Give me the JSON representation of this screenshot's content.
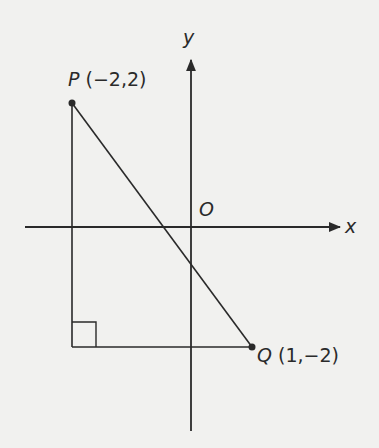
{
  "diagram": {
    "axes": {
      "x_label": "x",
      "y_label": "y",
      "origin_label": "O"
    },
    "points": [
      {
        "name": "P",
        "coords": "(−2, 2)",
        "x": -2,
        "y": 2
      },
      {
        "name": "Q",
        "coords": "(1, −2)",
        "x": 1,
        "y": -2
      }
    ],
    "labels": {
      "p_name": "P",
      "p_coords": "(−2,2)",
      "q_name": "Q",
      "q_coords": "(1,−2)"
    },
    "shapes": [
      "right triangle with legs parallel to axes",
      "segment PQ",
      "right-angle marker at (-2,-2)"
    ]
  }
}
